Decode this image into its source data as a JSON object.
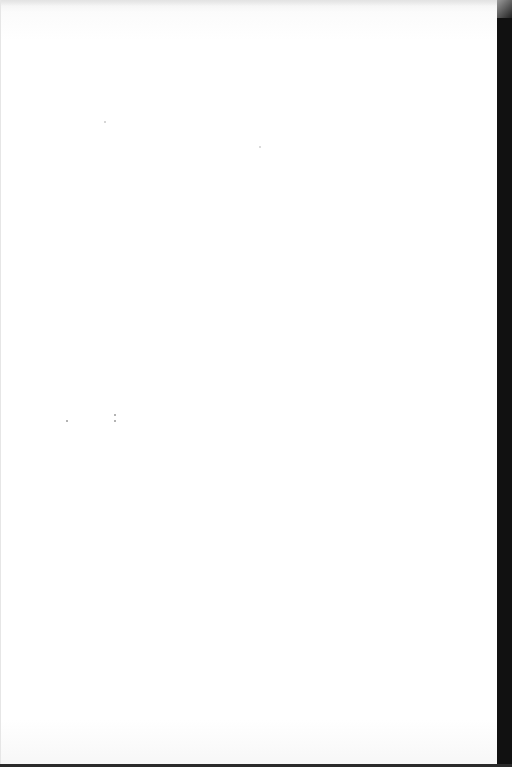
{
  "document": {
    "type": "scanned-page",
    "content": "",
    "colors": {
      "paper": "#ffffff",
      "edge": "#111111"
    }
  }
}
